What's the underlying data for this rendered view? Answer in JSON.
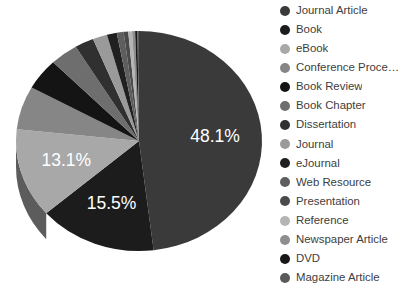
{
  "chart_data": {
    "type": "pie",
    "title": "",
    "subtitle": "",
    "xlabel": "",
    "ylabel": "",
    "grid": false,
    "legend_position": "right",
    "three_d": true,
    "background_color": "#ffffff",
    "label_text_color": "#ffffff",
    "legend_text_color": "#3d3d3d",
    "categories": [
      "Journal Article",
      "Book",
      "eBook",
      "Conference Proce…",
      "Book Review",
      "Book Chapter",
      "Dissertation",
      "Journal",
      "eJournal",
      "Web Resource",
      "Presentation",
      "Reference",
      "Newspaper Article",
      "DVD",
      "Magazine Article"
    ],
    "values": [
      48.1,
      15.5,
      13.1,
      6.4,
      4.6,
      3.7,
      2.5,
      1.9,
      1.3,
      0.9,
      0.6,
      0.5,
      0.4,
      0.3,
      0.2
    ],
    "colors": [
      "#3a3a3a",
      "#1c1c1c",
      "#a8a8a8",
      "#868686",
      "#141414",
      "#6e6e6e",
      "#303030",
      "#9a9a9a",
      "#202020",
      "#5e5e5e",
      "#4a4a4a",
      "#b4b4b4",
      "#8e8e8e",
      "#181818",
      "#5a5a5a"
    ],
    "visible_data_labels": [
      {
        "category": "Journal Article",
        "text": "48.1%",
        "value": 48.1
      },
      {
        "category": "Book",
        "text": "15.5%",
        "value": 15.5
      },
      {
        "category": "eBook",
        "text": "13.1%",
        "value": 13.1
      }
    ]
  }
}
